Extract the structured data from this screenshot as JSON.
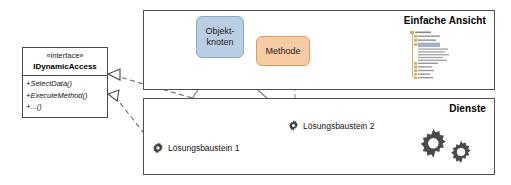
{
  "diagram": {
    "interface": {
      "stereotype": "«interface»",
      "name": "IDynamicAccess",
      "operations": [
        "+SelectData()",
        "+ExecuteMethod()",
        "+...()"
      ]
    },
    "panels": [
      {
        "id": "view",
        "title": "Einfache Ansicht"
      },
      {
        "id": "services",
        "title": "Dienste"
      }
    ],
    "nodes": [
      {
        "id": "objektknoten",
        "label": "Objekt-\nknoten",
        "line1": "Objekt-",
        "line2": "knoten",
        "color": "#b9cde4",
        "border": "#8ea9c4"
      },
      {
        "id": "methode",
        "label": "Methode",
        "color": "#f7cba4",
        "border": "#d99c62"
      }
    ],
    "building_blocks": [
      {
        "id": "lb1",
        "label": "Lösungsbaustein 1",
        "icon": "gear-icon"
      },
      {
        "id": "lb2",
        "label": "Lösungsbaustein 2",
        "icon": "gear-icon"
      }
    ],
    "service_icons": {
      "name": "gears-icon",
      "count": 2,
      "color": "#4b4b4b"
    },
    "thumbnail": {
      "name": "tree-view-thumbnail",
      "folder_color": "#c9b060",
      "highlight_color": "#9fb3d1"
    },
    "relations": [
      {
        "type": "realization",
        "from": "lb2",
        "to": "interface",
        "style": "dashed",
        "arrow": "hollow-triangle"
      },
      {
        "type": "realization",
        "from": "lb1",
        "to": "interface",
        "style": "dashed",
        "arrow": "hollow-triangle"
      },
      {
        "type": "association",
        "from": "objektknoten",
        "to": "lb1",
        "style": "solid"
      },
      {
        "type": "association",
        "from": "objektknoten",
        "to": "lb2",
        "style": "solid"
      },
      {
        "type": "association",
        "from": "methode",
        "to": "lb2",
        "style": "dashed"
      }
    ],
    "colors": {
      "line": "#7b7b7b",
      "border": "#4f4f4f",
      "text": "#111111"
    }
  }
}
